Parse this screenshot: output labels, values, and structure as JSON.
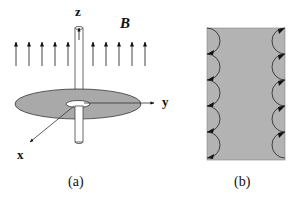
{
  "panel_a": {
    "caption": "(a)",
    "axes": {
      "x": "x",
      "y": "y",
      "z": "z"
    },
    "field_label": "B",
    "field_arrow_count": 10,
    "description": "Thin disk (annulus) in xy-plane pierced by a hollow cylinder along z; uniform field B pointing up"
  },
  "panel_b": {
    "caption": "(b)",
    "edge_arcs_per_side": 5,
    "description": "Rectangular slab with skipping-orbit semicircles along left and right edges"
  },
  "colors": {
    "disk_fill": "#a9a9a9",
    "slab_fill": "#b3b3b3",
    "line": "#222222"
  }
}
